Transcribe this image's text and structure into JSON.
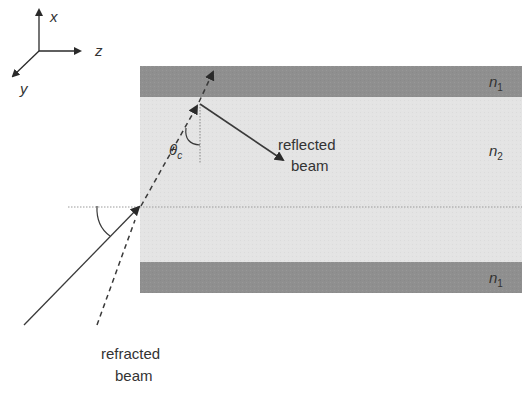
{
  "axes": {
    "x_label": "x",
    "y_label": "y",
    "z_label": "z"
  },
  "layers": {
    "cladding_top": {
      "label": "n",
      "subscript": "1",
      "color": "#8f8f8f"
    },
    "core": {
      "label": "n",
      "subscript": "2",
      "color": "#e4e4e4"
    },
    "cladding_bottom": {
      "label": "n",
      "subscript": "1",
      "color": "#8f8f8f"
    }
  },
  "angle_label": {
    "symbol": "θ",
    "subscript": "c"
  },
  "labels": {
    "reflected_line1": "reflected",
    "reflected_line2": "beam",
    "refracted_line1": "refracted",
    "refracted_line2": "beam"
  },
  "colors": {
    "line": "#3a3a3a",
    "dotted": "#9a9a9a"
  }
}
